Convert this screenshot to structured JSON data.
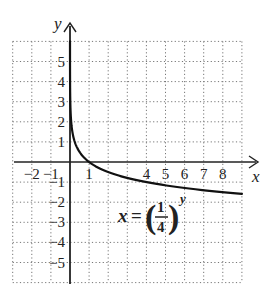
{
  "chart_data": {
    "type": "line",
    "title": "",
    "equation": "x = (1/4)^y",
    "equation_parts": {
      "lhs": "x",
      "eq": "=",
      "num": "1",
      "den": "4",
      "exp": "y"
    },
    "xlabel": "x",
    "ylabel": "y",
    "xlim": [
      -3,
      9
    ],
    "ylim": [
      -6,
      6
    ],
    "grid": true,
    "grid_style": "dotted",
    "x_tick_labels": [
      {
        "value": -2,
        "label": "−2"
      },
      {
        "value": -1,
        "label": "−1"
      },
      {
        "value": 1,
        "label": "1"
      },
      {
        "value": 4,
        "label": "4"
      },
      {
        "value": 5,
        "label": "5"
      },
      {
        "value": 6,
        "label": "6"
      },
      {
        "value": 7,
        "label": "7"
      },
      {
        "value": 8,
        "label": "8"
      }
    ],
    "y_tick_labels": [
      {
        "value": 5,
        "label": "5"
      },
      {
        "value": 4,
        "label": "4"
      },
      {
        "value": 3,
        "label": "3"
      },
      {
        "value": 2,
        "label": "2"
      },
      {
        "value": 1,
        "label": "1"
      },
      {
        "value": -1,
        "label": "−1"
      },
      {
        "value": -2,
        "label": "−2"
      },
      {
        "value": -3,
        "label": "−3"
      },
      {
        "value": -4,
        "label": "−4"
      },
      {
        "value": -5,
        "label": "−5"
      }
    ],
    "series": [
      {
        "name": "x = (1/4)^y",
        "color": "#111111",
        "points": [
          {
            "y": 6.0,
            "x": 0.0002
          },
          {
            "y": 4.0,
            "x": 0.0039
          },
          {
            "y": 3.0,
            "x": 0.0156
          },
          {
            "y": 2.0,
            "x": 0.0625
          },
          {
            "y": 1.5,
            "x": 0.125
          },
          {
            "y": 1.0,
            "x": 0.25
          },
          {
            "y": 0.5,
            "x": 0.5
          },
          {
            "y": 0.0,
            "x": 1.0
          },
          {
            "y": -0.5,
            "x": 2.0
          },
          {
            "y": -1.0,
            "x": 4.0
          },
          {
            "y": -1.25,
            "x": 5.66
          },
          {
            "y": -1.5,
            "x": 8.0
          },
          {
            "y": -1.585,
            "x": 9.0
          }
        ]
      }
    ]
  }
}
